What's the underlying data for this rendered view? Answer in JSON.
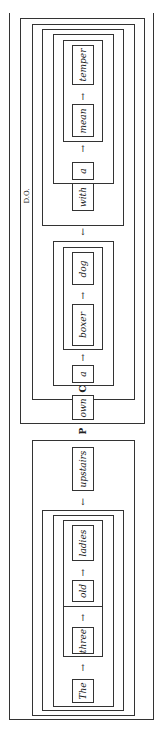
{
  "diagram": {
    "orientation": "rotated 90deg counter-clockwise",
    "predicate": {
      "object_phrase": {
        "words": [
          "a",
          "mean",
          "temper"
        ]
      },
      "connector": "with",
      "direct_object_label": "D.O.",
      "noun_phrase": {
        "words": [
          "a",
          "boxer",
          "dog"
        ]
      },
      "verb": "own",
      "verb_label": "C"
    },
    "predicate_label": "P",
    "subject": {
      "words": [
        "The",
        "three",
        "old",
        "ladies"
      ],
      "modifier": "upstairs"
    },
    "arrow": "↑",
    "down_arrow": "↓"
  }
}
